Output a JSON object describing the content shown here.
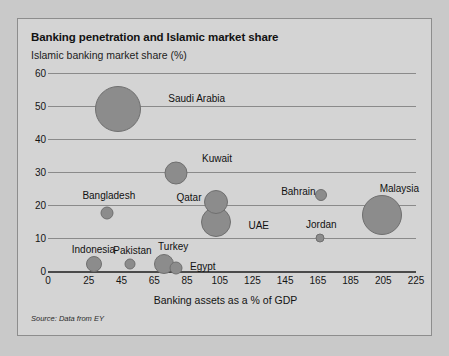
{
  "panel": {
    "title": "Banking penetration and Islamic market share",
    "subtitle": "Islamic banking market share (%)",
    "source": "Source: Data from EY"
  },
  "chart_data": {
    "type": "scatter",
    "title": "Banking penetration and Islamic market share",
    "subtitle": "Islamic banking market share (%)",
    "xlabel": "Banking assets as a % of GDP",
    "ylabel": "Islamic banking market share (%)",
    "xlim": [
      0,
      225
    ],
    "ylim": [
      0,
      60
    ],
    "xticks": [
      0,
      25,
      45,
      65,
      85,
      105,
      125,
      145,
      165,
      185,
      205,
      225
    ],
    "yticks": [
      0,
      10,
      20,
      30,
      40,
      50,
      60
    ],
    "grid": true,
    "legend": "none",
    "bubble_color": "#8c8c8c",
    "points": [
      {
        "name": "Saudi Arabia",
        "x": 43,
        "y": 49,
        "r": 23,
        "label_dx": 27,
        "label_dy": -10
      },
      {
        "name": "Kuwait",
        "x": 78,
        "y": 29.7,
        "r": 11.5,
        "label_dx": 15,
        "label_dy": -14
      },
      {
        "name": "Qatar",
        "x": 103,
        "y": 21,
        "r": 12,
        "label_dx": -52,
        "label_dy": -4
      },
      {
        "name": "UAE",
        "x": 103,
        "y": 15,
        "r": 15,
        "label_dx": 17,
        "label_dy": 4
      },
      {
        "name": "Bangladesh",
        "x": 36,
        "y": 17.5,
        "r": 6.5,
        "label_dx": -31,
        "label_dy": -17
      },
      {
        "name": "Bahrain",
        "x": 167,
        "y": 23,
        "r": 6,
        "label_dx": -46,
        "label_dy": -3
      },
      {
        "name": "Jordan",
        "x": 166,
        "y": 10,
        "r": 4.5,
        "label_dx": -18,
        "label_dy": -13
      },
      {
        "name": "Malaysia",
        "x": 204,
        "y": 17,
        "r": 20,
        "label_dx": -22,
        "label_dy": -26
      },
      {
        "name": "Indonesia",
        "x": 28,
        "y": 2,
        "r": 8,
        "label_dx": -30,
        "label_dy": -14
      },
      {
        "name": "Pakistan",
        "x": 50,
        "y": 2,
        "r": 5.5,
        "label_dx": -22,
        "label_dy": -13
      },
      {
        "name": "Turkey",
        "x": 71,
        "y": 2.2,
        "r": 10,
        "label_dx": -16,
        "label_dy": -17
      },
      {
        "name": "Egypt",
        "x": 78,
        "y": 1,
        "r": 6.5,
        "label_dx": 8,
        "label_dy": -1
      }
    ]
  }
}
